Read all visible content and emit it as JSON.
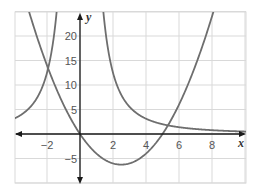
{
  "chart_data": {
    "type": "line",
    "title": "",
    "xlabel": "x",
    "ylabel": "y",
    "xlim": [
      -4,
      10
    ],
    "ylim": [
      -10,
      25
    ],
    "grid": true,
    "x_ticks": [
      "−2",
      "2",
      "4",
      "6",
      "8"
    ],
    "x_tick_values": [
      -2,
      2,
      4,
      6,
      8
    ],
    "y_ticks": [
      "20",
      "15",
      "10",
      "5",
      "−5"
    ],
    "y_tick_values": [
      20,
      15,
      10,
      5,
      -5
    ],
    "series": [
      {
        "name": "y = x² − 5x",
        "kind": "parabola",
        "points": [
          [
            -3,
            24
          ],
          [
            -2,
            14
          ],
          [
            -1,
            6
          ],
          [
            0,
            0
          ],
          [
            1,
            -4
          ],
          [
            2,
            -6
          ],
          [
            2.5,
            -6.25
          ],
          [
            3,
            -6
          ],
          [
            4,
            -4
          ],
          [
            5,
            0
          ],
          [
            6,
            6
          ],
          [
            7,
            14
          ],
          [
            8,
            24
          ]
        ]
      },
      {
        "name": "y = 50/x²",
        "kind": "reciprocal-square",
        "points": [
          [
            -4,
            3.1
          ],
          [
            -3,
            5.6
          ],
          [
            -2,
            12.5
          ],
          [
            -1.5,
            22.2
          ],
          [
            1.5,
            22.2
          ],
          [
            2,
            12.5
          ],
          [
            3,
            5.6
          ],
          [
            4,
            3.1
          ],
          [
            6,
            1.4
          ],
          [
            8,
            0.8
          ],
          [
            10,
            0.5
          ]
        ]
      }
    ],
    "colors": {
      "curve": "#6e6e6e",
      "grid": "#d9d9d9",
      "axis": "#1a1a1a"
    }
  }
}
